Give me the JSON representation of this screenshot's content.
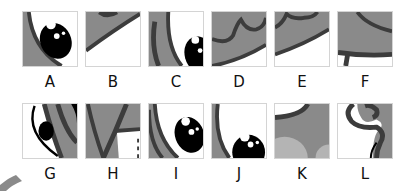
{
  "puzzle": {
    "colors": {
      "fill_gray": "#8a8a8a",
      "line_dark": "#3c3c3c",
      "eye_black": "#000000",
      "light_gray": "#b4b4b4",
      "border": "#d4d4d4"
    },
    "rows": [
      {
        "tiles": [
          {
            "label": "A",
            "content": "eye-with-curve"
          },
          {
            "label": "B",
            "content": "curved-band"
          },
          {
            "label": "C",
            "content": "curves-and-eye"
          },
          {
            "label": "D",
            "content": "wavy-lines"
          },
          {
            "label": "E",
            "content": "arc-band"
          },
          {
            "label": "F",
            "content": "arc-and-base"
          }
        ]
      },
      {
        "tiles": [
          {
            "label": "G",
            "content": "eye-outline-curves"
          },
          {
            "label": "H",
            "content": "gray-with-crossbar"
          },
          {
            "label": "I",
            "content": "curve-and-eye"
          },
          {
            "label": "J",
            "content": "eye-bottom"
          },
          {
            "label": "K",
            "content": "gray-with-blobs"
          },
          {
            "label": "L",
            "content": "hook-curve"
          }
        ]
      }
    ]
  }
}
